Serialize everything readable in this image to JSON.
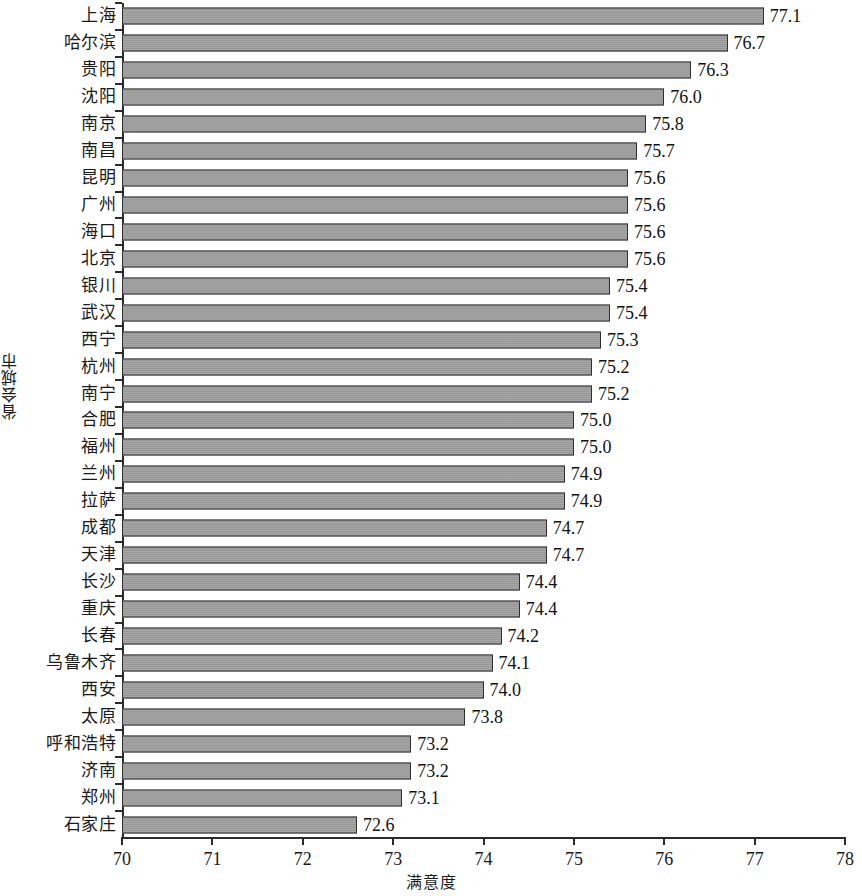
{
  "chart_data": {
    "type": "bar",
    "orientation": "horizontal",
    "title": "",
    "xlabel": "满意度",
    "ylabel": "省会城市",
    "xlim": [
      70,
      78
    ],
    "xticks": [
      "70",
      "71",
      "72",
      "73",
      "74",
      "75",
      "76",
      "77",
      "78"
    ],
    "grid": false,
    "legend": null,
    "bar_color": "#9d9d9d",
    "bar_edge_color": "#2f2f2f",
    "axis_color": "#2b2b2b",
    "categories": [
      "上海",
      "哈尔滨",
      "贵阳",
      "沈阳",
      "南京",
      "南昌",
      "昆明",
      "广州",
      "海口",
      "北京",
      "银川",
      "武汉",
      "西宁",
      "杭州",
      "南宁",
      "合肥",
      "福州",
      "兰州",
      "拉萨",
      "成都",
      "天津",
      "长沙",
      "重庆",
      "长春",
      "乌鲁木齐",
      "西安",
      "太原",
      "呼和浩特",
      "济南",
      "郑州",
      "石家庄"
    ],
    "values": [
      77.1,
      76.7,
      76.3,
      76.0,
      75.8,
      75.7,
      75.6,
      75.6,
      75.6,
      75.6,
      75.4,
      75.4,
      75.3,
      75.2,
      75.2,
      75.0,
      75.0,
      74.9,
      74.9,
      74.7,
      74.7,
      74.4,
      74.4,
      74.2,
      74.1,
      74.0,
      73.8,
      73.2,
      73.2,
      73.1,
      72.6
    ],
    "value_labels": [
      "77.1",
      "76.7",
      "76.3",
      "76.0",
      "75.8",
      "75.7",
      "75.6",
      "75.6",
      "75.6",
      "75.6",
      "75.4",
      "75.4",
      "75.3",
      "75.2",
      "75.2",
      "75.0",
      "75.0",
      "74.9",
      "74.9",
      "74.7",
      "74.7",
      "74.4",
      "74.4",
      "74.2",
      "74.1",
      "74.0",
      "73.8",
      "73.2",
      "73.2",
      "73.1",
      "72.6"
    ]
  }
}
